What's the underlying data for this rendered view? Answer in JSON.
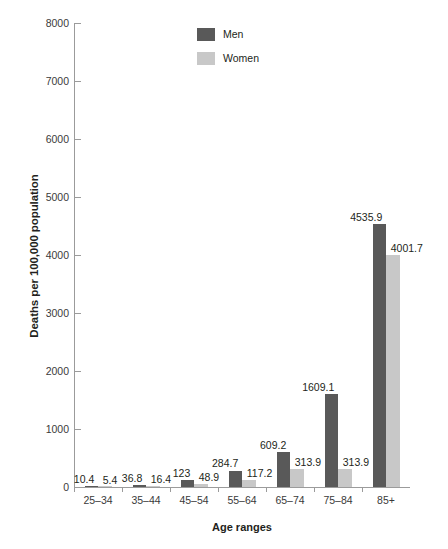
{
  "chart_data": {
    "type": "bar",
    "title": "",
    "subtitle": "",
    "xlabel": "Age ranges",
    "ylabel": "Deaths per 100,000 population",
    "categories": [
      "25–34",
      "35–44",
      "45–54",
      "55–64",
      "65–74",
      "75–84",
      "85+"
    ],
    "series": [
      {
        "name": "Men",
        "color": "#595959",
        "values": [
          10.4,
          36.8,
          123,
          284.7,
          609.2,
          1609.1,
          4535.9
        ],
        "labels": [
          "10.4",
          "36.8",
          "123",
          "284.7",
          "609.2",
          "1609.1",
          "4535.9"
        ]
      },
      {
        "name": "Women",
        "color": "#c8c8c8",
        "values": [
          5.4,
          16.4,
          48.9,
          117.2,
          313.9,
          313.9,
          4001.7
        ],
        "labels": [
          "5.4",
          "16.4",
          "48.9",
          "117.2",
          "313.9",
          "313.9",
          "4001.7"
        ]
      }
    ],
    "ylim": [
      0,
      8000
    ],
    "yticks": [
      0,
      1000,
      2000,
      3000,
      4000,
      5000,
      6000,
      7000,
      8000
    ],
    "ytick_labels": [
      "0",
      "1000",
      "2000",
      "3000",
      "4000",
      "5000",
      "6000",
      "7000",
      "8000"
    ],
    "grid": false,
    "legend_position": "top-center"
  },
  "legend": {
    "entries": [
      {
        "label": "Men",
        "color": "#595959"
      },
      {
        "label": "Women",
        "color": "#c8c8c8"
      }
    ]
  },
  "axes": {
    "y_title": "Deaths per 100,000 population",
    "x_title": "Age ranges"
  }
}
